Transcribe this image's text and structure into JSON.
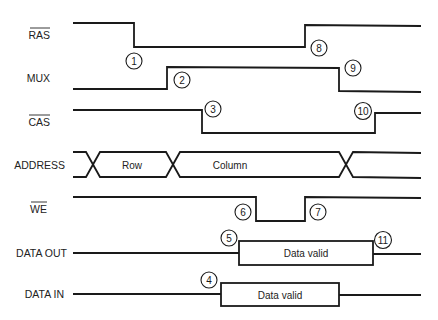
{
  "diagram": {
    "type": "timing-diagram",
    "signals": [
      {
        "id": "ras",
        "label": "RAS",
        "active_low": true
      },
      {
        "id": "mux",
        "label": "MUX",
        "active_low": false
      },
      {
        "id": "cas",
        "label": "CAS",
        "active_low": true
      },
      {
        "id": "address",
        "label": "ADDRESS",
        "active_low": false,
        "segments": [
          "Row",
          "Column"
        ]
      },
      {
        "id": "we",
        "label": "WE",
        "active_low": true
      },
      {
        "id": "data_out",
        "label": "DATA OUT",
        "active_low": false,
        "segment": "Data valid"
      },
      {
        "id": "data_in",
        "label": "DATA IN",
        "active_low": false,
        "segment": "Data valid"
      }
    ],
    "events": [
      {
        "n": "1",
        "signal": "RAS",
        "desc": "RAS falls"
      },
      {
        "n": "2",
        "signal": "MUX",
        "desc": "MUX rises"
      },
      {
        "n": "3",
        "signal": "CAS",
        "desc": "CAS falls"
      },
      {
        "n": "4",
        "signal": "DATA IN",
        "desc": "Data in valid"
      },
      {
        "n": "5",
        "signal": "DATA OUT",
        "desc": "Data out valid"
      },
      {
        "n": "6",
        "signal": "WE",
        "desc": "WE falls"
      },
      {
        "n": "7",
        "signal": "WE",
        "desc": "WE rises"
      },
      {
        "n": "8",
        "signal": "RAS",
        "desc": "RAS rises"
      },
      {
        "n": "9",
        "signal": "MUX",
        "desc": "MUX falls"
      },
      {
        "n": "10",
        "signal": "CAS",
        "desc": "CAS rises"
      },
      {
        "n": "11",
        "signal": "DATA OUT",
        "desc": "Data out ends"
      }
    ]
  },
  "labels": {
    "ras": "RAS",
    "mux": "MUX",
    "cas": "CAS",
    "address": "ADDRESS",
    "we": "WE",
    "data_out": "DATA OUT",
    "data_in": "DATA IN",
    "row": "Row",
    "column": "Column",
    "data_valid_out": "Data valid",
    "data_valid_in": "Data valid"
  },
  "markers": {
    "m1": "1",
    "m2": "2",
    "m3": "3",
    "m4": "4",
    "m5": "5",
    "m6": "6",
    "m7": "7",
    "m8": "8",
    "m9": "9",
    "m10": "10",
    "m11": "11"
  }
}
